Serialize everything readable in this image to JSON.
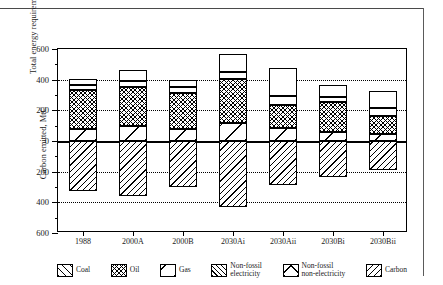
{
  "figure": {
    "caption": "",
    "frame_color": "#4a4a4a"
  },
  "axes": {
    "y_top_title": "Total energy requirement, Mtoe",
    "y_bottom_title": "Carbon emitted, MtC",
    "y_tick_labels": [
      "600",
      "400",
      "200",
      "0",
      "200",
      "400",
      "600"
    ],
    "y_tick_values": [
      600,
      400,
      200,
      0,
      -200,
      -400,
      -600
    ],
    "x_tick_labels": [
      "1988",
      "2000A",
      "2000B",
      "2030Ai",
      "2030Aii",
      "2030Bi",
      "2030Bii"
    ]
  },
  "legend": {
    "items": [
      {
        "label": "Coal",
        "pattern": "p-coal"
      },
      {
        "label": "Oil",
        "pattern": "p-oil"
      },
      {
        "label": "Gas",
        "pattern": "p-gas"
      },
      {
        "label": "Non-fossil\nelectricity",
        "pattern": "p-nfe"
      },
      {
        "label": "Non-fossil\nnon-electricity",
        "pattern": "p-nfne"
      },
      {
        "label": "Carbon",
        "pattern": "p-carbon"
      }
    ]
  },
  "chart_data": {
    "type": "bar",
    "title": "",
    "subtitle": "",
    "xlabel": "",
    "ylabel": "Total energy requirement, Mtoe / Carbon emitted, MtC",
    "ylim": [
      -600,
      600
    ],
    "grid": true,
    "gridlines": [
      400,
      200,
      -200,
      -400
    ],
    "legend_position": "bottom",
    "stacked": true,
    "orientation": "vertical",
    "note": "Values above the zero line are energy in Mtoe (stacked: Coal, Gas, Oil, Non-fossil electricity, Non-fossil non-electricity). Values below the zero line are carbon emitted in MtC, plotted as positive magnitudes downward.",
    "categories": [
      "1988",
      "2000A",
      "2000B",
      "2030Ai",
      "2030Aii",
      "2030Bi",
      "2030Bii"
    ],
    "series": [
      {
        "name": "Coal",
        "unit": "Mtoe",
        "values": [
          0,
          0,
          0,
          0,
          0,
          0,
          0
        ]
      },
      {
        "name": "Gas",
        "unit": "Mtoe",
        "values": [
          80,
          97,
          80,
          120,
          85,
          57,
          47
        ]
      },
      {
        "name": "Oil",
        "unit": "Mtoe",
        "values": [
          250,
          258,
          232,
          285,
          150,
          195,
          113
        ]
      },
      {
        "name": "Non-fossil electricity",
        "unit": "Mtoe",
        "values": [
          35,
          38,
          38,
          45,
          60,
          35,
          55
        ]
      },
      {
        "name": "Non-fossil non-electricity",
        "unit": "Mtoe",
        "values": [
          38,
          70,
          50,
          120,
          180,
          78,
          110
        ]
      },
      {
        "name": "Carbon",
        "unit": "MtC",
        "values": [
          325,
          358,
          300,
          428,
          290,
          238,
          188
        ]
      }
    ],
    "totals_energy_mtoe": [
      403,
      463,
      400,
      570,
      475,
      365,
      325
    ],
    "totals_carbon_mtc": [
      325,
      358,
      300,
      428,
      290,
      238,
      188
    ]
  }
}
